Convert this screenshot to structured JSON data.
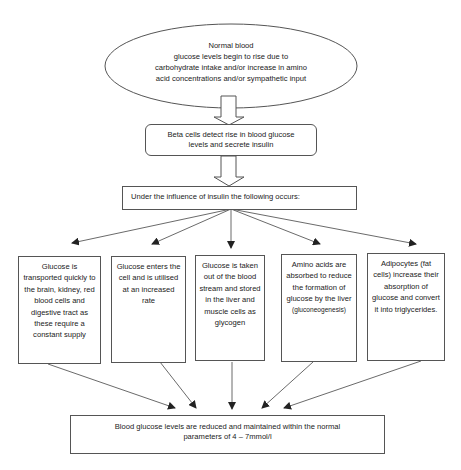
{
  "diagram": {
    "start_node": {
      "line1": "Normal blood",
      "line2": "glucose levels begin to rise due to",
      "line3": "carbohydrate intake and/or increase in amino",
      "line4": "acid concentrations and/or sympathetic input"
    },
    "beta_node": {
      "line1": "Beta cells detect rise in blood glucose",
      "line2": "levels and secrete insulin"
    },
    "influence_node": {
      "text": "Under the influence of insulin the following occurs:"
    },
    "effects": [
      {
        "text": "Glucose is transported quickly to the brain, kidney, red blood cells and digestive tract as these require a constant supply"
      },
      {
        "text": "Glucose enters the cell and is utilised at an increased rate"
      },
      {
        "text": "Glucose is taken out of the blood stream and stored in the liver and muscle cells as glycogen"
      },
      {
        "text": "Amino acids are absorbed to reduce the formation of glucose by the liver",
        "note": "(gluconeogenesis)"
      },
      {
        "text": "Adipocytes (fat cells) increase their absorption of glucose and convert it into triglycerides."
      }
    ],
    "result_node": {
      "line1": "Blood glucose levels are reduced and maintained within the normal",
      "line2": "parameters of 4 – 7mmol/l"
    },
    "colors": {
      "stroke": "#555555",
      "text": "#222222",
      "background": "#ffffff"
    }
  }
}
